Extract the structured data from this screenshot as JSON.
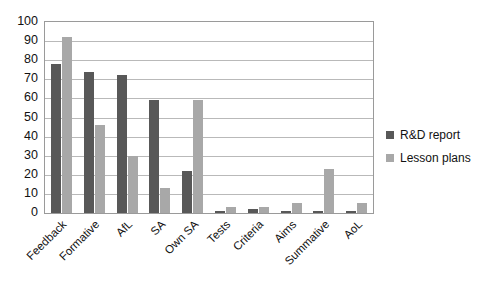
{
  "chart_data": {
    "type": "bar",
    "title": "",
    "xlabel": "",
    "ylabel": "",
    "ylim": [
      0,
      100
    ],
    "ytick_step": 10,
    "yticks": [
      "100",
      "90",
      "80",
      "70",
      "60",
      "50",
      "40",
      "30",
      "20",
      "10",
      "0"
    ],
    "grid": true,
    "legend_position": "right",
    "categories": [
      "Feedback",
      "Formative",
      "AfL",
      "SA",
      "Own SA",
      "Tests",
      "Criteria",
      "Aims",
      "Summative",
      "AoL"
    ],
    "series": [
      {
        "name": "R&D report",
        "color": "#585858",
        "values": [
          78,
          74,
          72,
          59,
          22,
          1,
          2,
          1,
          1,
          1
        ]
      },
      {
        "name": "Lesson plans",
        "color": "#a8a8a8",
        "values": [
          92,
          46,
          30,
          13,
          59,
          3,
          3,
          5,
          23,
          5
        ]
      }
    ]
  },
  "legend": {
    "items": [
      {
        "label": "R&D report",
        "color": "#585858"
      },
      {
        "label": "Lesson plans",
        "color": "#a8a8a8"
      }
    ]
  },
  "colors": {
    "series_dark": "#585858",
    "series_light": "#a8a8a8",
    "gridline": "#b9b9b9",
    "axis": "#9a9a9a",
    "text": "#111111",
    "background": "#ffffff"
  }
}
